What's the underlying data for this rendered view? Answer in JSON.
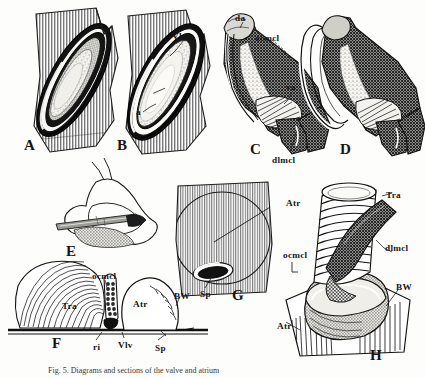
{
  "figure": {
    "background_color": "#fdfdfb",
    "ink_color": "#151515",
    "caption": "Fig. 5.  Diagrams and sections of the valve and atrium"
  },
  "panels": [
    {
      "id": "A",
      "letter": "A",
      "description": "hatched tissue block containing elongate oval valve aperture, stippled interior",
      "letter_pos": {
        "x": 24,
        "y": 138
      },
      "annotations": []
    },
    {
      "id": "B",
      "letter": "B",
      "description": "hatched tissue block with open oval valve, leader lines to Vlv and a",
      "letter_pos": {
        "x": 117,
        "y": 138
      },
      "annotations": [
        {
          "label": "Vlv",
          "x": 172,
          "y": 32
        },
        {
          "label": "a",
          "x": 136,
          "y": 108
        }
      ]
    },
    {
      "id": "C",
      "letter": "C",
      "description": "oblique view of muscular valve collar with dark cross-hatched musculature",
      "letter_pos": {
        "x": 250,
        "y": 142
      },
      "annotations": [
        {
          "label": "da",
          "x": 235,
          "y": 14
        },
        {
          "label": "ocmcl",
          "x": 255,
          "y": 34
        },
        {
          "label": "va",
          "x": 286,
          "y": 83
        },
        {
          "label": "dlmcl",
          "x": 272,
          "y": 156
        }
      ]
    },
    {
      "id": "D",
      "letter": "D",
      "description": "companion oblique view of valve collar, rotated, showing ring and muscle sheet",
      "letter_pos": {
        "x": 340,
        "y": 142
      },
      "annotations": []
    },
    {
      "id": "E",
      "letter": "E",
      "description": "outline drawing of articulated skeletal element with stippled region and inserted rod",
      "letter_pos": {
        "x": 66,
        "y": 244
      },
      "annotations": []
    },
    {
      "id": "F",
      "letter": "F",
      "description": "longitudinal section showing trabeculae, circular muscle, atrium and body wall",
      "letter_pos": {
        "x": 52,
        "y": 336
      },
      "annotations": [
        {
          "label": "ocmcl",
          "x": 92,
          "y": 272
        },
        {
          "label": "Tra",
          "x": 62,
          "y": 302
        },
        {
          "label": "Atr",
          "x": 133,
          "y": 300
        },
        {
          "label": "BW",
          "x": 174,
          "y": 292
        },
        {
          "label": "ri",
          "x": 93,
          "y": 343
        },
        {
          "label": "Vlv",
          "x": 118,
          "y": 341
        },
        {
          "label": "Sp",
          "x": 155,
          "y": 344
        }
      ]
    },
    {
      "id": "G",
      "letter": "G",
      "description": "surface view of hatched body wall block with outlined atrium and central siphon pore",
      "letter_pos": {
        "x": 232,
        "y": 288
      },
      "annotations": [
        {
          "label": "Atr",
          "x": 286,
          "y": 199
        },
        {
          "label": "Sp",
          "x": 200,
          "y": 290
        }
      ]
    },
    {
      "id": "H",
      "letter": "H",
      "description": "three-dimensional reconstruction of ringed trabecular tube seated in body wall",
      "letter_pos": {
        "x": 370,
        "y": 348
      },
      "annotations": [
        {
          "label": "Tra",
          "x": 386,
          "y": 191
        },
        {
          "label": "ocmcl",
          "x": 283,
          "y": 251
        },
        {
          "label": "dlmcl",
          "x": 385,
          "y": 244
        },
        {
          "label": "BW",
          "x": 396,
          "y": 283
        },
        {
          "label": "Atr",
          "x": 277,
          "y": 322
        }
      ]
    }
  ],
  "legend_terms": [
    {
      "abbr": "Atr",
      "meaning": "atrium"
    },
    {
      "abbr": "BW",
      "meaning": "body wall"
    },
    {
      "abbr": "da",
      "meaning": "dorsal attachment"
    },
    {
      "abbr": "dlmcl",
      "meaning": "dorso-lateral muscle"
    },
    {
      "abbr": "ocmcl",
      "meaning": "outer circular muscle"
    },
    {
      "abbr": "ri",
      "meaning": "ring"
    },
    {
      "abbr": "Sp",
      "meaning": "siphon pore"
    },
    {
      "abbr": "Tra",
      "meaning": "trabecula"
    },
    {
      "abbr": "va",
      "meaning": "ventral attachment"
    },
    {
      "abbr": "Vlv",
      "meaning": "valve"
    },
    {
      "abbr": "a",
      "meaning": "aperture"
    }
  ]
}
